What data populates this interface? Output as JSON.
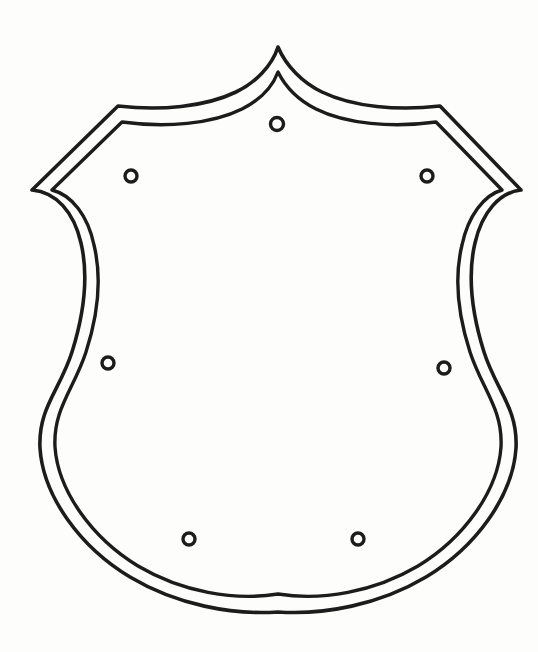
{
  "document": {
    "title": "Shield Badge Outline Template",
    "background_color": "#fdfdfc",
    "stroke_color": "#1c1c1c",
    "canvas_width": 538,
    "canvas_height": 652
  },
  "chart_data": {
    "type": "diagram",
    "xlabel": "",
    "ylabel": "",
    "grid": false,
    "legend": null,
    "shapes": [
      {
        "name": "outer-shield-outline",
        "kind": "closed-path",
        "stroke": "#1c1c1c",
        "stroke_width": 3.6,
        "fill": "none",
        "key_points": {
          "top_apex": [
            278,
            47
          ],
          "left_shoulder": [
            118,
            106
          ],
          "right_shoulder": [
            440,
            106
          ],
          "left_point_tip": [
            32,
            190
          ],
          "right_point_tip": [
            521,
            190
          ],
          "left_waist": [
            72,
            352
          ],
          "right_waist": [
            472,
            344
          ],
          "left_lower_bulge": [
            40,
            448
          ],
          "right_lower_bulge": [
            502,
            448
          ],
          "bottom_tip": [
            278,
            612
          ]
        }
      },
      {
        "name": "inner-shield-outline",
        "kind": "closed-path",
        "stroke": "#1c1c1c",
        "stroke_width": 3.4,
        "fill": "none",
        "key_points": {
          "top_apex": [
            278,
            72
          ],
          "left_shoulder": [
            122,
            122
          ],
          "right_shoulder": [
            436,
            122
          ],
          "left_point_tip": [
            52,
            190
          ],
          "right_point_tip": [
            502,
            190
          ],
          "left_waist": [
            86,
            352
          ],
          "right_waist": [
            458,
            344
          ],
          "left_lower_bulge": [
            55,
            448
          ],
          "right_lower_bulge": [
            487,
            448
          ],
          "bottom_tip": [
            278,
            594
          ]
        }
      }
    ],
    "rivets": [
      {
        "name": "rivet-top-center",
        "cx": 277,
        "cy": 124,
        "r": 6.5
      },
      {
        "name": "rivet-upper-left",
        "cx": 131,
        "cy": 176,
        "r": 6.0
      },
      {
        "name": "rivet-upper-right",
        "cx": 427,
        "cy": 176,
        "r": 6.0
      },
      {
        "name": "rivet-middle-left",
        "cx": 108,
        "cy": 363,
        "r": 6.0
      },
      {
        "name": "rivet-middle-right",
        "cx": 444,
        "cy": 368,
        "r": 6.0
      },
      {
        "name": "rivet-bottom-left",
        "cx": 189,
        "cy": 539,
        "r": 6.0
      },
      {
        "name": "rivet-bottom-right",
        "cx": 358,
        "cy": 539,
        "r": 6.0
      }
    ],
    "rivet_count": 7,
    "annotations": []
  }
}
